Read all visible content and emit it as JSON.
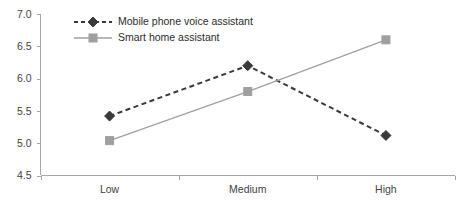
{
  "chart_data": {
    "type": "line",
    "title": "",
    "xlabel": "",
    "ylabel": "",
    "categories": [
      "Low",
      "Medium",
      "High"
    ],
    "series": [
      {
        "name": "Mobile phone voice assistant",
        "values": [
          5.42,
          6.2,
          5.12
        ],
        "color": "#3a3a3a",
        "line_style": "dashed",
        "marker": "diamond"
      },
      {
        "name": "Smart home assistant",
        "values": [
          5.04,
          5.8,
          6.6
        ],
        "color": "#a0a0a0",
        "line_style": "solid",
        "marker": "square"
      }
    ],
    "ylim": [
      4.5,
      7.0
    ],
    "ytick_labels": [
      "7.0",
      "6.5",
      "6.0",
      "5.5",
      "5.0",
      "4.5"
    ],
    "ytick_values": [
      7.0,
      6.5,
      6.0,
      5.5,
      5.0,
      4.5
    ],
    "grid": false,
    "legend_position": "top-center-inside",
    "legend": [
      "Mobile phone voice assistant",
      "Smart home assistant"
    ]
  },
  "axes": {
    "y_axis_name": "value-axis",
    "x_axis_name": "category-axis"
  }
}
